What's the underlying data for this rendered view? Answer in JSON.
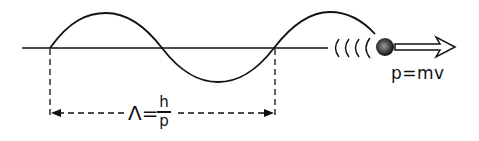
{
  "diagram": {
    "particle": {
      "icon": "particle-ball-icon",
      "momentum_label": "p=mv",
      "motion_arrow_icon": "hollow-arrow-right-icon",
      "trail_icon": "motion-trail-arcs-icon"
    },
    "wavelength": {
      "symbol": "Λ",
      "equals": "=",
      "numerator": "h",
      "denominator": "p",
      "dimension_arrow_icon": "double-headed-dashed-arrow-icon"
    },
    "colors": {
      "stroke": "#111111",
      "background": "#ffffff"
    }
  }
}
